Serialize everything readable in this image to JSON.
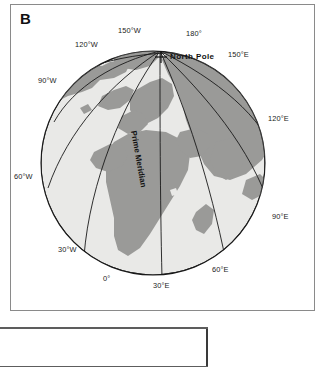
{
  "figure": {
    "panel_letter": "B",
    "pole_marker_label": "North Pole",
    "prime_meridian_label": "Prime Meridian"
  },
  "meridian_labels": [
    {
      "text": "150°W",
      "x": 118,
      "y": 26
    },
    {
      "text": "180°",
      "x": 186,
      "y": 29
    },
    {
      "text": "120°W",
      "x": 75,
      "y": 40
    },
    {
      "text": "150°E",
      "x": 228,
      "y": 50
    },
    {
      "text": "90°W",
      "x": 38,
      "y": 76
    },
    {
      "text": "120°E",
      "x": 268,
      "y": 114
    },
    {
      "text": "60°W",
      "x": 14,
      "y": 172
    },
    {
      "text": "90°E",
      "x": 272,
      "y": 212
    },
    {
      "text": "30°W",
      "x": 58,
      "y": 245
    },
    {
      "text": "60°E",
      "x": 212,
      "y": 265
    },
    {
      "text": "0°",
      "x": 103,
      "y": 274
    },
    {
      "text": "30°E",
      "x": 153,
      "y": 281
    }
  ],
  "colors": {
    "ocean": "#e8e8e6",
    "land": "#9a9a98",
    "outline": "#1a1a1a",
    "frame": "#8a8a8a",
    "text": "#1a1a1a"
  },
  "globe": {
    "center_x": 153,
    "center_y": 163,
    "radius": 112,
    "projection": "orthographic-polar-oblique",
    "graticule_meridians": 12
  }
}
